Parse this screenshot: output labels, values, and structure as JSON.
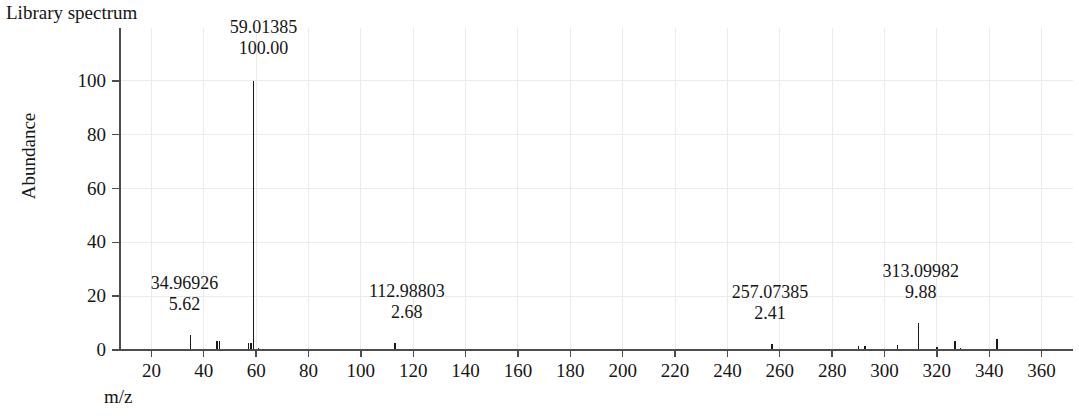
{
  "figure": {
    "title": "Library spectrum",
    "x_axis_title": "m/z",
    "y_axis_title": "Abundance"
  },
  "chart_data": {
    "type": "bar",
    "title": "Library spectrum",
    "subtitle": "",
    "xlabel": "m/z",
    "ylabel": "Abundance",
    "xlim": [
      8,
      372
    ],
    "ylim": [
      0,
      107
    ],
    "grid": true,
    "grid_color": "#ebebeb",
    "legend": "none",
    "axis_color": "#4d4d4d",
    "peak_color": "#1a1a1a",
    "xticks": [
      20,
      40,
      60,
      80,
      100,
      120,
      140,
      160,
      180,
      200,
      220,
      240,
      260,
      280,
      300,
      320,
      340,
      360
    ],
    "yticks": [
      0,
      20,
      40,
      60,
      80,
      100
    ],
    "x": [
      28.0,
      34.96926,
      39.0,
      45.0,
      46.0,
      50.0,
      57.0,
      58.0,
      59.01385,
      61.0,
      69.0,
      83.0,
      93.0,
      112.98803,
      135.0,
      159.0,
      181.0,
      207.0,
      231.0,
      257.07385,
      275.0,
      290.0,
      292.5,
      299.0,
      305.0,
      313.09982,
      320.0,
      327.0,
      329.0,
      343.0
    ],
    "values": [
      0.5,
      5.62,
      0.4,
      3.3,
      3.3,
      0.4,
      2.6,
      2.5,
      100.0,
      0.6,
      0.35,
      0.5,
      0.3,
      2.68,
      0.3,
      0.25,
      0.3,
      0.3,
      0.35,
      2.41,
      0.3,
      1.4,
      1.6,
      0.4,
      2.0,
      9.88,
      1.1,
      3.4,
      0.9,
      4.2
    ],
    "labeled_peaks": [
      {
        "mz": "34.96926",
        "abundance": "5.62",
        "x": 34.96926,
        "y": 5.62
      },
      {
        "mz": "59.01385",
        "abundance": "100.00",
        "x": 59.01385,
        "y": 100.0
      },
      {
        "mz": "112.98803",
        "abundance": "2.68",
        "x": 112.98803,
        "y": 2.68
      },
      {
        "mz": "257.07385",
        "abundance": "2.41",
        "x": 257.07385,
        "y": 2.41
      },
      {
        "mz": "313.09982",
        "abundance": "9.88",
        "x": 313.09982,
        "y": 9.88
      }
    ]
  }
}
